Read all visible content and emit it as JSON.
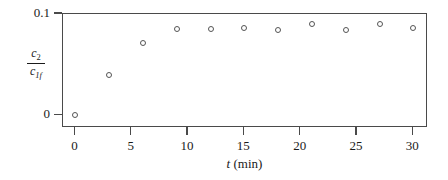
{
  "chart_data": {
    "type": "scatter",
    "title": "",
    "xlabel": "t (min)",
    "xlabel_var": "t",
    "xlabel_units": "(min)",
    "ylabel_numerator": "c",
    "ylabel_numerator_sub": "2",
    "ylabel_denominator": "c",
    "ylabel_denominator_sub": "1f",
    "ylabel_text": "c2 / c1f",
    "x": [
      0,
      3,
      6,
      9,
      12,
      15,
      18,
      21,
      24,
      27,
      30
    ],
    "values": [
      0.0,
      0.04,
      0.071,
      0.085,
      0.085,
      0.086,
      0.084,
      0.0905,
      0.0845,
      0.0905,
      0.086
    ],
    "xlim": [
      -1.1,
      31.3
    ],
    "ylim": [
      -0.0125,
      0.1
    ],
    "xticks": [
      0,
      5,
      10,
      15,
      20,
      25,
      30
    ],
    "xticklabels": [
      "0",
      "5",
      "10",
      "15",
      "20",
      "25",
      "30"
    ],
    "yticks": [
      0,
      0.1
    ],
    "yticklabels": [
      "0",
      "0.1"
    ],
    "grid": false,
    "legend": null,
    "marker": "open-circle",
    "marker_color": "#545454",
    "frame_color": "#4a4a4a"
  }
}
